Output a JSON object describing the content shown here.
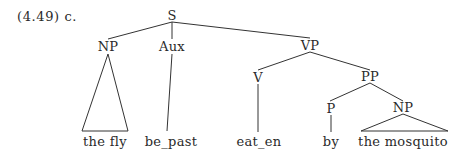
{
  "example_label": "(4.49) c.",
  "nodes": {
    "S": "S",
    "NP1": "NP",
    "Aux": "Aux",
    "VP": "VP",
    "V": "V",
    "PP": "PP",
    "P": "P",
    "NP2": "NP"
  },
  "leaves": {
    "the_fly": "the fly",
    "be_past": "be_past",
    "eat_en": "eat_en",
    "by": "by",
    "the_mosquito": "the mosquito"
  },
  "colors": {
    "line": "#333333",
    "text": "#2a2a2a",
    "background": "#ffffff"
  }
}
